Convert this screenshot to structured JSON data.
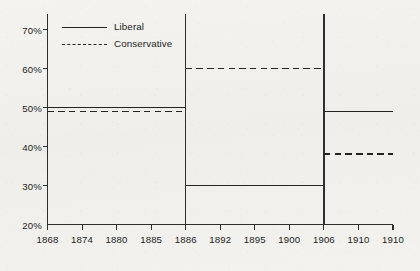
{
  "chart_data": {
    "type": "line",
    "title": "",
    "subtitle": "",
    "xlabel": "",
    "ylabel": "",
    "grid": false,
    "legend_position": "top-left",
    "xlim": [
      1868,
      1910
    ],
    "ylim": [
      20,
      74
    ],
    "y_ticks": [
      "30%",
      "40%",
      "50%",
      "60%",
      "70%"
    ],
    "y_tick_values": [
      30,
      40,
      50,
      60,
      70
    ],
    "y_axis_start_label": "20%",
    "x_ticks": [
      "1868",
      "1874",
      "1880",
      "1885",
      "1886",
      "1892",
      "1895",
      "1900",
      "1906",
      "1910",
      "1910"
    ],
    "x_tick_values": [
      1868,
      1874,
      1880,
      1885,
      1886,
      1892,
      1895,
      1900,
      1906,
      1910,
      1910
    ],
    "dividers": [
      1886,
      1906
    ],
    "series": [
      {
        "name": "Liberal",
        "style": "solid",
        "color": "#232323",
        "segments": [
          {
            "x_start": 1868,
            "x_end": 1886,
            "value": 50
          },
          {
            "x_start": 1886,
            "x_end": 1906,
            "value": 30
          },
          {
            "x_start": 1906,
            "x_end": 1910,
            "value": 49
          }
        ]
      },
      {
        "name": "Conservative",
        "style": "dashed",
        "color": "#232323",
        "segments": [
          {
            "x_start": 1868,
            "x_end": 1886,
            "value": 49
          },
          {
            "x_start": 1886,
            "x_end": 1906,
            "value": 60
          },
          {
            "x_start": 1906,
            "x_end": 1910,
            "value": 38
          }
        ]
      }
    ]
  },
  "legend": {
    "items": [
      {
        "label": "Liberal",
        "style": "solid"
      },
      {
        "label": "Conservative",
        "style": "dashed"
      }
    ]
  }
}
